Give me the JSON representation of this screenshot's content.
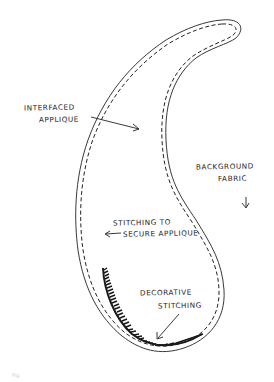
{
  "diagram": {
    "colors": {
      "background": "#ffffff",
      "ink": "#222222",
      "decorative_stitching": "#1a1a1a"
    },
    "labels": {
      "interfaced_applique": {
        "line1": "INTERFACED",
        "line2": "APPLIQUE"
      },
      "background_fabric": {
        "line1": "BACKGROUND",
        "line2": "FABRIC"
      },
      "stitching_to_secure": {
        "line1": "STITCHING TO",
        "line2": "SECURE APPLIQUE"
      },
      "decorative_stitching": {
        "line1": "DECORATIVE",
        "line2": "STITCHING"
      }
    },
    "figure_caption": "Fig."
  }
}
